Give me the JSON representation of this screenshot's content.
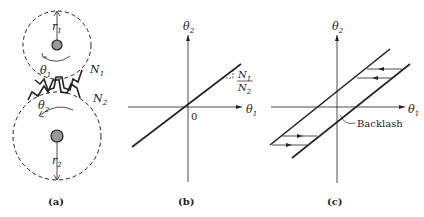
{
  "panels": {
    "a": {
      "caption": "(a)",
      "labels": {
        "r1": "r",
        "r1_sub": "1",
        "r2": "r",
        "r2_sub": "2",
        "theta1": "θ",
        "theta1_sub": "1",
        "theta2": "θ",
        "theta2_sub": "2",
        "N1": "N",
        "N1_sub": "1",
        "N2": "N",
        "N2_sub": "2"
      }
    },
    "b": {
      "caption": "(b)",
      "labels": {
        "yaxis": "θ",
        "yaxis_sub": "2",
        "xaxis": "θ",
        "xaxis_sub": "1",
        "origin": "0",
        "slope_num": "N",
        "slope_num_sub": "1",
        "slope_den": "N",
        "slope_den_sub": "2",
        "unit": "1"
      }
    },
    "c": {
      "caption": "(c)",
      "labels": {
        "yaxis": "θ",
        "yaxis_sub": "2",
        "xaxis": "θ",
        "xaxis_sub": "1",
        "backlash": "Backlash"
      }
    }
  }
}
